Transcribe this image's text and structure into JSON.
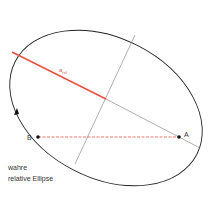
{
  "diagram": {
    "labels": {
      "semi_major": "a",
      "semi_major_sub": "rel",
      "point_a": "A",
      "point_b": "B",
      "caption_line1": "wahre",
      "caption_line2": "relative Ellipse"
    },
    "colors": {
      "ellipse": "#222222",
      "axis": "#666666",
      "semi_major": "#e8544a",
      "dashed": "#e8544a",
      "point": "#111111",
      "text": "#333333"
    }
  }
}
